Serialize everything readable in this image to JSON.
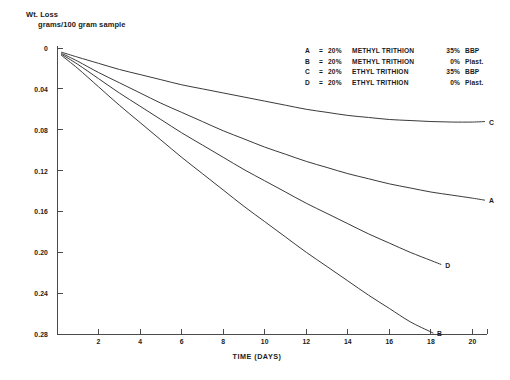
{
  "chart_data": {
    "type": "line",
    "title": "Wt. Loss",
    "subtitle": "grams/100 gram sample",
    "xlabel": "TIME (DAYS)",
    "ylabel": "Wt. Loss grams/100 gram sample",
    "xlim": [
      0,
      20.7
    ],
    "ylim": [
      0,
      0.28
    ],
    "y_inverted": true,
    "grid": false,
    "legend_position": "top-right",
    "xticks": [
      2,
      4,
      6,
      8,
      10,
      12,
      14,
      16,
      18,
      20
    ],
    "xtick_labels": [
      "2",
      "4",
      "6",
      "8",
      "10",
      "12",
      "14",
      "16",
      "18",
      "20"
    ],
    "yticks": [
      0,
      0.04,
      0.08,
      0.12,
      0.16,
      0.2,
      0.24,
      0.28
    ],
    "ytick_labels": [
      "0",
      "0.04",
      "0.08",
      "0.12",
      "0.16",
      "0.20",
      "0.24",
      "0.28"
    ],
    "series": [
      {
        "name": "C",
        "label": "C",
        "legend": "C = 20%   ETHYL TRITHION   35% BBP",
        "x": [
          0.2,
          1,
          2,
          3,
          4,
          5,
          6,
          7,
          8,
          9,
          10,
          11,
          12,
          13,
          14,
          15,
          16,
          17,
          18,
          19,
          20,
          20.6
        ],
        "y": [
          0.004,
          0.009,
          0.015,
          0.021,
          0.026,
          0.031,
          0.036,
          0.04,
          0.044,
          0.048,
          0.052,
          0.056,
          0.06,
          0.063,
          0.066,
          0.068,
          0.07,
          0.071,
          0.072,
          0.0725,
          0.0725,
          0.072
        ]
      },
      {
        "name": "A",
        "label": "A",
        "legend": "A = 20% METHYL TRITHION   35% BBP",
        "x": [
          0.2,
          1,
          2,
          3,
          4,
          5,
          6,
          7,
          8,
          9,
          10,
          11,
          12,
          13,
          14,
          15,
          16,
          17,
          18,
          19,
          20,
          20.6
        ],
        "y": [
          0.005,
          0.013,
          0.024,
          0.034,
          0.044,
          0.054,
          0.063,
          0.072,
          0.081,
          0.089,
          0.097,
          0.104,
          0.111,
          0.117,
          0.123,
          0.128,
          0.133,
          0.137,
          0.141,
          0.144,
          0.147,
          0.149
        ]
      },
      {
        "name": "D",
        "label": "D",
        "legend": "D = 20%   ETHYL TRITHION    0% Plast.",
        "x": [
          0.2,
          1,
          2,
          3,
          4,
          5,
          6,
          7,
          8,
          9,
          10,
          11,
          12,
          13,
          14,
          15,
          16,
          17,
          18,
          18.5
        ],
        "y": [
          0.006,
          0.016,
          0.03,
          0.044,
          0.057,
          0.07,
          0.083,
          0.095,
          0.107,
          0.119,
          0.13,
          0.141,
          0.152,
          0.162,
          0.172,
          0.182,
          0.191,
          0.2,
          0.208,
          0.212
        ]
      },
      {
        "name": "B",
        "label": "B",
        "legend": "B = 20% METHYL TRITHION    0% Plast.",
        "x": [
          0.2,
          1,
          2,
          3,
          4,
          5,
          6,
          7,
          8,
          9,
          10,
          11,
          12,
          13,
          14,
          15,
          16,
          17,
          18,
          18.1
        ],
        "y": [
          0.007,
          0.02,
          0.038,
          0.056,
          0.073,
          0.09,
          0.107,
          0.123,
          0.139,
          0.155,
          0.17,
          0.185,
          0.2,
          0.214,
          0.228,
          0.242,
          0.255,
          0.268,
          0.278,
          0.279
        ]
      }
    ],
    "legend_entries": [
      {
        "key": "A",
        "eq": "=",
        "pct": "20%",
        "chem": "METHYL TRITHION",
        "load": "35%",
        "plast": "BBP"
      },
      {
        "key": "B",
        "eq": "=",
        "pct": "20%",
        "chem": "METHYL TRITHION",
        "load": "0%",
        "plast": "Plast."
      },
      {
        "key": "C",
        "eq": "=",
        "pct": "20%",
        "chem": "ETHYL TRITHION",
        "load": "35%",
        "plast": "BBP"
      },
      {
        "key": "D",
        "eq": "=",
        "pct": "20%",
        "chem": "ETHYL TRITHION",
        "load": "0%",
        "plast": "Plast."
      }
    ],
    "colors": {
      "axis": "#4a4a4a",
      "curve": "#3a3a3a",
      "text": "#1a1a1a"
    }
  }
}
